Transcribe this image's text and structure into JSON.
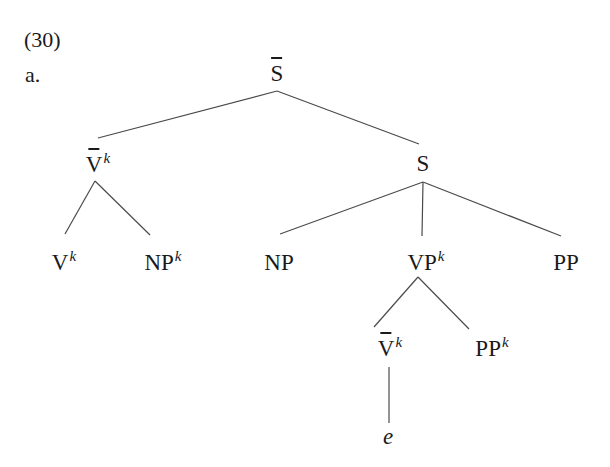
{
  "example": {
    "number": "(30)",
    "sublabel": "a."
  },
  "tree": {
    "nodes": {
      "sbar": {
        "base": "S",
        "bar": true,
        "sup": ""
      },
      "vbar_top": {
        "base": "V",
        "bar": true,
        "sup": "k"
      },
      "s": {
        "base": "S",
        "bar": false,
        "sup": ""
      },
      "v": {
        "base": "V",
        "bar": false,
        "sup": "k"
      },
      "np_k": {
        "base": "NP",
        "bar": false,
        "sup": "k"
      },
      "np": {
        "base": "NP",
        "bar": false,
        "sup": ""
      },
      "vp_k": {
        "base": "VP",
        "bar": false,
        "sup": "k"
      },
      "pp": {
        "base": "PP",
        "bar": false,
        "sup": ""
      },
      "vbar_low": {
        "base": "V",
        "bar": true,
        "sup": "k"
      },
      "pp_k": {
        "base": "PP",
        "bar": false,
        "sup": "k"
      },
      "e": {
        "base": "e",
        "bar": false,
        "sup": ""
      }
    },
    "edges": [
      [
        "sbar",
        "vbar_top"
      ],
      [
        "sbar",
        "s"
      ],
      [
        "vbar_top",
        "v"
      ],
      [
        "vbar_top",
        "np_k"
      ],
      [
        "s",
        "np"
      ],
      [
        "s",
        "vp_k"
      ],
      [
        "s",
        "pp"
      ],
      [
        "vp_k",
        "vbar_low"
      ],
      [
        "vp_k",
        "pp_k"
      ],
      [
        "vbar_low",
        "e"
      ]
    ]
  }
}
